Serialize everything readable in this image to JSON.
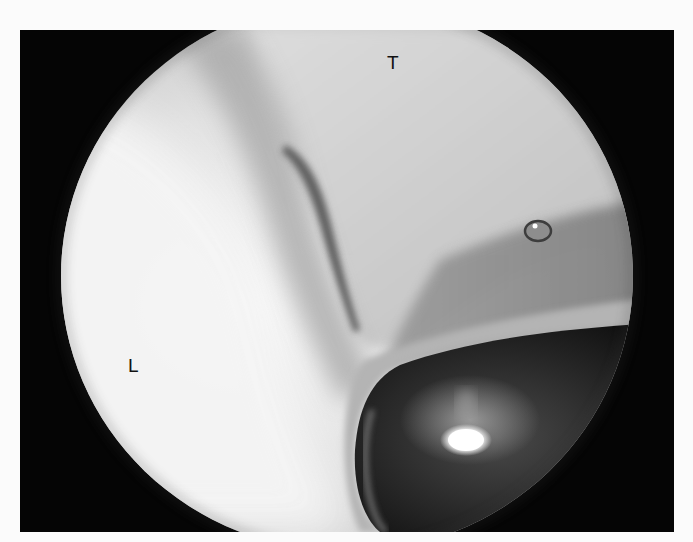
{
  "figure": {
    "type": "arthroscopic-view",
    "colors": {
      "frame": "#050505",
      "tissue_light": "#f2f2f2",
      "tissue_mid": "#c8c8c8",
      "shadow": "#6a6a6a",
      "instrument_dark": "#1a1a1a",
      "highlight": "#ffffff",
      "page_background": "#fbfbfb"
    },
    "labels": [
      {
        "id": "T",
        "text": "T"
      },
      {
        "id": "L",
        "text": "L"
      }
    ]
  }
}
